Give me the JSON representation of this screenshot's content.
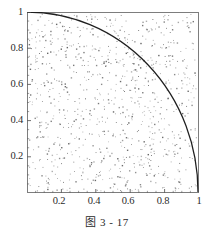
{
  "caption": "图 3 - 17",
  "chart_data": {
    "type": "scatter",
    "title": "",
    "subtitle": "",
    "xlabel": "",
    "ylabel": "",
    "xlim": [
      0,
      1
    ],
    "ylim": [
      0,
      1
    ],
    "grid": false,
    "legend": null,
    "frame": "box",
    "annotations": [],
    "xticks": [
      0.2,
      0.4,
      0.6,
      0.8,
      1
    ],
    "xtick_labels": [
      "0.2",
      "0.4",
      "0.6",
      "0.8",
      "1"
    ],
    "yticks": [
      0.2,
      0.4,
      0.6,
      0.8,
      1
    ],
    "ytick_labels": [
      "0.2",
      "0.4",
      "0.6",
      "0.8",
      "1"
    ],
    "minor_ticks": true,
    "point_color": "#8a8a8a",
    "curve_color": "#1f1f1f",
    "frame_color": "#7d7d7d",
    "n_points": 900,
    "series": [
      {
        "name": "uniform random points",
        "type": "scatter",
        "marker": "dot",
        "note": "uniformly distributed points in the unit square"
      },
      {
        "name": "quarter circle x^2 + y^2 = 1",
        "type": "line",
        "x": [
          0,
          0.05,
          0.1,
          0.15,
          0.2,
          0.25,
          0.3,
          0.35,
          0.4,
          0.45,
          0.5,
          0.55,
          0.6,
          0.65,
          0.7,
          0.75,
          0.8,
          0.85,
          0.9,
          0.95,
          0.975,
          1
        ],
        "y": [
          1,
          0.9987,
          0.995,
          0.9887,
          0.9798,
          0.9682,
          0.9539,
          0.9367,
          0.9165,
          0.893,
          0.866,
          0.8352,
          0.8,
          0.7599,
          0.7141,
          0.6614,
          0.6,
          0.5268,
          0.4359,
          0.3122,
          0.2222,
          0
        ]
      }
    ]
  }
}
